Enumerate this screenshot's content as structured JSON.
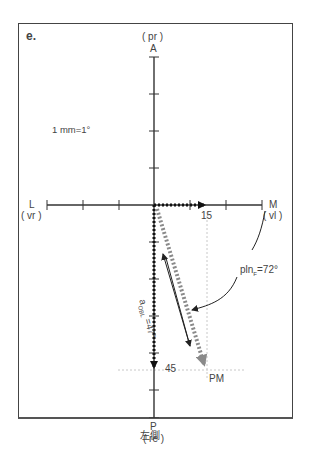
{
  "panel_label": "e.",
  "scale_note": "1 mm=1°",
  "axes": {
    "top": {
      "letter": "A",
      "sub": "( pr )"
    },
    "bottom": {
      "letter": "P",
      "sub": "( re )"
    },
    "left": {
      "letter": "L",
      "sub": "( vr )"
    },
    "right": {
      "letter": "M",
      "sub": "( vl )"
    }
  },
  "values": {
    "x_component": "15",
    "y_component": "45"
  },
  "annotations": {
    "pln": "pln",
    "pln_sub": "F",
    "pln_value": "=72°",
    "aobl": "a",
    "aobl_sub": "OBL",
    "aobl_value": " =47°",
    "endpoint": "PM"
  },
  "caption": "左側",
  "colors": {
    "axis": "#333333",
    "dotted_arrow": "#111111",
    "resultant_arrow": "#8a8a8a",
    "guide": "#c8c8c8"
  }
}
